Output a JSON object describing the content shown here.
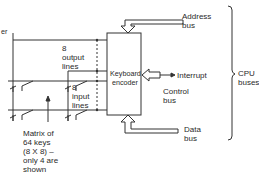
{
  "diagram": {
    "edge_label_partial": "er",
    "encoder": {
      "label": "Keyboard\nencoder"
    },
    "output_lines": {
      "count": "8",
      "label": "8\noutput\nlines"
    },
    "input_lines": {
      "count": "8",
      "label": "8\ninput\nlines"
    },
    "matrix_note": "Matrix of\n64 keys\n(8 X 8) –\nonly 4 are\nshown",
    "buses": {
      "address": "Address\nbus",
      "control": "Control\nbus",
      "interrupt": "Interrupt",
      "data": "Data\nbus",
      "group": "CPU\nbuses"
    },
    "key_switches_shown": 4,
    "colors": {
      "line": "#333333",
      "background": "#ffffff"
    }
  }
}
